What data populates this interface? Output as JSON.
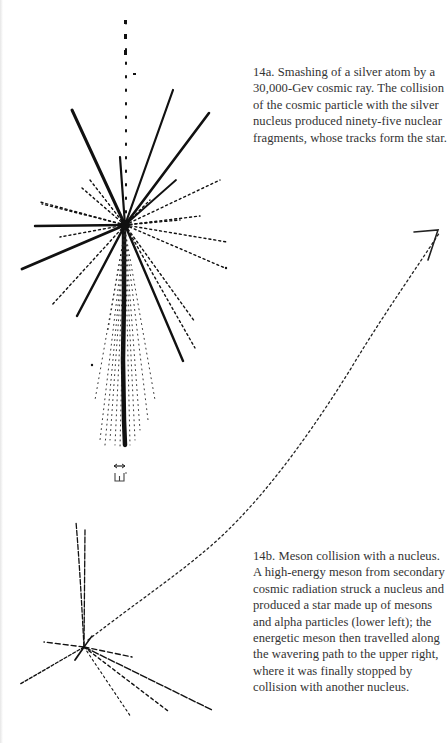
{
  "figures": [
    {
      "id": "14a",
      "caption_lines": [
        "14a. Smashing of a silver atom by a",
        "30,000-Gev cosmic ray. The collision",
        "of the cosmic particle with the silver",
        "nucleus produced ninety-five nuclear",
        "fragments, whose tracks form the star."
      ],
      "illustration": "cosmic-ray-star-photograph"
    },
    {
      "id": "14b",
      "caption_lines": [
        "14b. Meson collision with a nucleus.",
        "A high-energy meson from secondary",
        "cosmic radiation struck a nucleus and",
        "produced a star made up of mesons",
        "and alpha particles (lower left); the",
        "energetic meson then travelled along",
        "the wavering path to the upper right,",
        "where it was finally stopped by",
        "collision with another nucleus."
      ],
      "illustration": "meson-track-photograph"
    }
  ],
  "scale_marker": "scale-bar"
}
